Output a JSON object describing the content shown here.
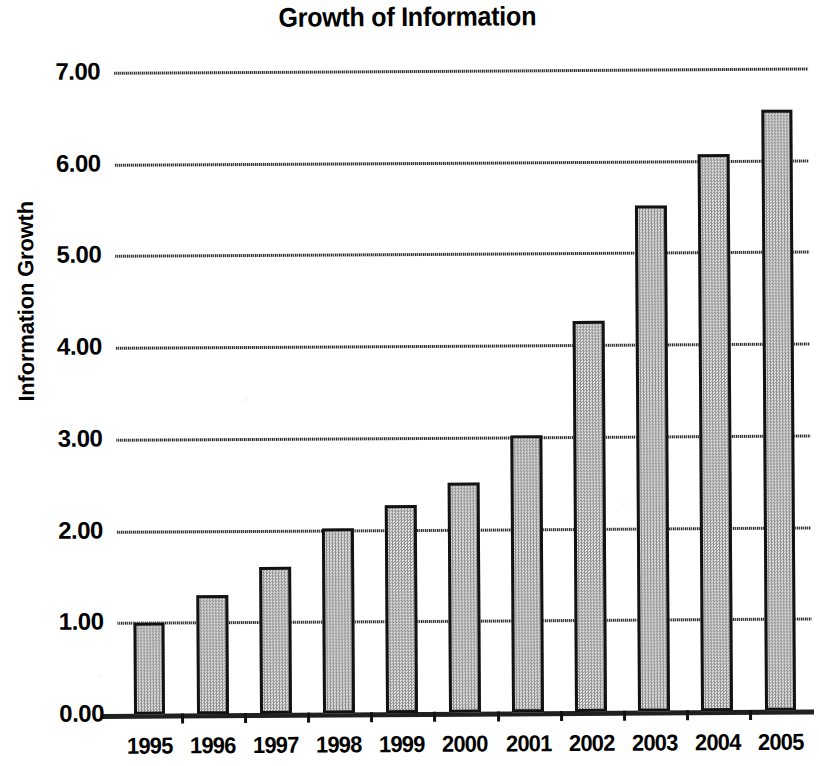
{
  "chart_data": {
    "type": "bar",
    "title": "Growth of Information",
    "xlabel": "",
    "ylabel": "Information Growth",
    "categories": [
      "1995",
      "1996",
      "1997",
      "1998",
      "1999",
      "2000",
      "2001",
      "2002",
      "2003",
      "2004",
      "2005"
    ],
    "values": [
      1.0,
      1.3,
      1.6,
      2.02,
      2.27,
      2.51,
      3.02,
      4.26,
      5.52,
      6.07,
      6.55
    ],
    "ylim": [
      0,
      7
    ],
    "ytick_labels": [
      "0.00",
      "1.00",
      "2.00",
      "3.00",
      "4.00",
      "5.00",
      "6.00",
      "7.00"
    ],
    "ytick_values": [
      0,
      1,
      2,
      3,
      4,
      5,
      6,
      7
    ],
    "grid": true,
    "grid_axis": "y",
    "legend": false,
    "legend_position": "none",
    "series": [
      {
        "name": "Information Growth",
        "values": [
          1.0,
          1.3,
          1.6,
          2.02,
          2.27,
          2.51,
          3.02,
          4.26,
          5.52,
          6.07,
          6.55
        ]
      }
    ]
  },
  "style": {
    "bar_fill_color": "#c6c6c6",
    "bar_border_color": "#121212",
    "grid_color": "#3a3a3a",
    "axis_color": "#0d0d0d",
    "background_color": "#ffffff",
    "text_color": "#000000"
  }
}
